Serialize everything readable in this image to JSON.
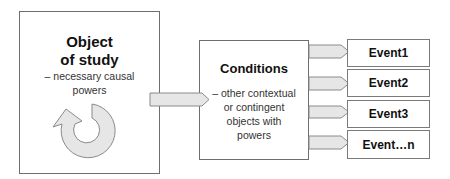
{
  "object_of_study": {
    "title_line1": "Object",
    "title_line2": "of study",
    "desc_line1": "– necessary causal",
    "desc_line2": "powers",
    "icon": "circular-arrow-icon"
  },
  "conditions": {
    "title": "Conditions",
    "desc_line1": "– other contextual",
    "desc_line2": "or contingent",
    "desc_line3": "objects with",
    "desc_line4": "powers"
  },
  "events": [
    {
      "label": "Event1"
    },
    {
      "label": "Event2"
    },
    {
      "label": "Event3"
    },
    {
      "label": "Event…n"
    }
  ],
  "colors": {
    "arrow_fill": "#e6e6e6",
    "arrow_stroke": "#8a8a8a",
    "box_border": "#6e6e6e"
  }
}
